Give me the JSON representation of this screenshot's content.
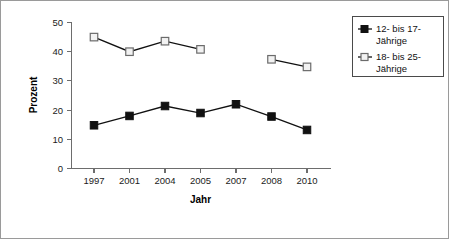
{
  "chart_data": {
    "type": "line",
    "title": "",
    "xlabel": "Jahr",
    "ylabel": "Prozent",
    "categories": [
      "1997",
      "2001",
      "2004",
      "2005",
      "2007",
      "2008",
      "2010"
    ],
    "ylim": [
      0,
      50
    ],
    "yticks": [
      "0",
      "10",
      "20",
      "30",
      "40",
      "50"
    ],
    "grid": false,
    "legend_position": "top-right",
    "series": [
      {
        "name": "12- bis 17-Jährige",
        "marker": "filled-square",
        "color": "#111111",
        "values": [
          14.8,
          18.0,
          21.4,
          19.0,
          22.0,
          17.8,
          13.2
        ]
      },
      {
        "name": "18- bis 25-Jährige",
        "marker": "open-square",
        "color": "#6b6b6b",
        "values": [
          45.0,
          40.0,
          43.6,
          40.8,
          null,
          37.4,
          34.8
        ]
      }
    ]
  },
  "legend": {
    "entries": [
      {
        "line1": "12- bis 17-",
        "line2": "Jährige"
      },
      {
        "line1": "18- bis 25-",
        "line2": "Jährige"
      }
    ]
  },
  "axes": {
    "y_title": "Prozent",
    "x_title": "Jahr"
  }
}
